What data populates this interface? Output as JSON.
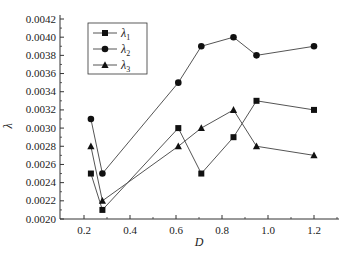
{
  "chart_data": {
    "type": "line",
    "title": "",
    "xlabel": "D",
    "ylabel": "λ",
    "xlim": [
      0.1,
      1.3
    ],
    "ylim": [
      0.002,
      0.0042
    ],
    "xticks": [
      "0.2",
      "0.4",
      "0.6",
      "0.8",
      "1.0",
      "1.2"
    ],
    "yticks": [
      "0.0020",
      "0.0022",
      "0.0024",
      "0.0026",
      "0.0028",
      "0.0030",
      "0.0032",
      "0.0034",
      "0.0036",
      "0.0038",
      "0.0040",
      "0.0042"
    ],
    "grid": false,
    "legend_position": "upper-left",
    "x": [
      0.23,
      0.28,
      0.61,
      0.71,
      0.85,
      0.95,
      1.2
    ],
    "series": [
      {
        "name": "λ1",
        "label_base": "λ",
        "label_sub": "1",
        "marker": "square",
        "values": [
          0.0025,
          0.0021,
          0.003,
          0.0025,
          0.0029,
          0.0033,
          0.0032
        ]
      },
      {
        "name": "λ2",
        "label_base": "λ",
        "label_sub": "2",
        "marker": "circle",
        "values": [
          0.0031,
          0.0025,
          0.0035,
          0.0039,
          0.004,
          0.0038,
          0.0039
        ]
      },
      {
        "name": "λ3",
        "label_base": "λ",
        "label_sub": "3",
        "marker": "triangle",
        "values": [
          0.0028,
          0.0022,
          0.0028,
          0.003,
          0.0032,
          0.0028,
          0.0027
        ]
      }
    ]
  },
  "colors": {
    "line": "#555555",
    "marker": "#111111",
    "axis": "#333333"
  }
}
